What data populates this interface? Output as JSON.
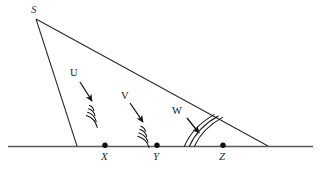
{
  "figure": {
    "caption_fragment": "",
    "apex_label": "S",
    "baseline_points": [
      {
        "id": "X",
        "label": "X",
        "x": 105,
        "y": 146
      },
      {
        "id": "Y",
        "label": "Y",
        "x": 157,
        "y": 146
      },
      {
        "id": "Z",
        "label": "Z",
        "x": 223,
        "y": 146
      }
    ],
    "wave_labels": [
      {
        "id": "U",
        "label": "U",
        "x": 74,
        "y": 73
      },
      {
        "id": "V",
        "label": "V",
        "x": 124,
        "y": 96
      },
      {
        "id": "W",
        "label": "W",
        "x": 177,
        "y": 111
      }
    ],
    "geometry": {
      "apex": {
        "x": 36,
        "y": 18
      },
      "left_foot": {
        "x": 77,
        "y": 146
      },
      "right_foot": {
        "x": 268,
        "y": 146
      },
      "baseline_start_x": 8,
      "baseline_end_x": 313,
      "baseline_y": 146
    },
    "colors": {
      "ink": "#262626",
      "baseline": "#5a5a5a",
      "point_dot": "#101010",
      "background": "#ffffff"
    },
    "icon_names": [
      "wavefront-arcs-icon",
      "pointer-arrow-icon",
      "point-dot-icon"
    ]
  }
}
